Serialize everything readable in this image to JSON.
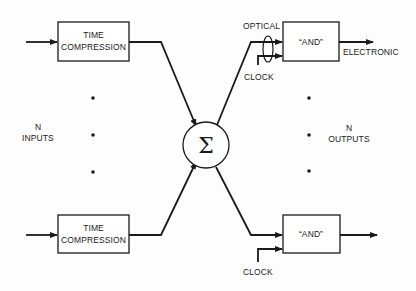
{
  "diagram": {
    "left": {
      "top_block": {
        "line1": "TIME",
        "line2": "COMPRESSION"
      },
      "bottom_block": {
        "line1": "TIME",
        "line2": "COMPRESSION"
      },
      "group_label": {
        "line1": "N",
        "line2": "INPUTS"
      }
    },
    "center": {
      "summer_symbol": "Σ"
    },
    "right": {
      "top_gate": {
        "label": "“AND”",
        "optical_label": "OPTICAL",
        "clock_label": "CLOCK",
        "output_label": "ELECTRONIC"
      },
      "bottom_gate": {
        "label": "“AND”",
        "clock_label": "CLOCK"
      },
      "group_label": {
        "line1": "N",
        "line2": "OUTPUTS"
      }
    },
    "colors": {
      "ink": "#1a1a1a",
      "background": "#fdfdfd"
    }
  }
}
